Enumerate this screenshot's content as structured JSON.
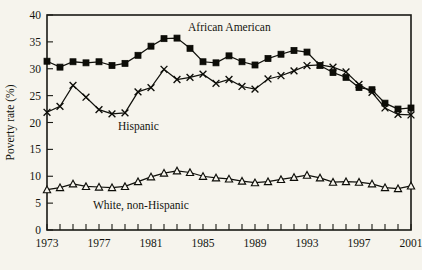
{
  "figure": {
    "background_color": "#f6f4ed",
    "ink_color": "#14140f",
    "width": 422,
    "height": 270
  },
  "axes": {
    "ylabel": "Poverty rate (%)",
    "xlabel": "",
    "y_ticks": [
      "0",
      "5",
      "10",
      "15",
      "20",
      "25",
      "30",
      "35",
      "40"
    ],
    "x_ticks": [
      "1973",
      "1977",
      "1981",
      "1985",
      "1989",
      "1993",
      "1997",
      "2001"
    ]
  },
  "annotations": {
    "african_american_label": "African American",
    "hispanic_label": "Hispanic",
    "white_label": "White, non-Hispanic"
  },
  "chart_data": {
    "type": "line",
    "title": "",
    "xlabel": "",
    "ylabel": "Poverty rate (%)",
    "xlim": [
      1973,
      2001
    ],
    "ylim": [
      0,
      40
    ],
    "ytick_step": 5,
    "xtick_step": 1,
    "xtick_label_step": 4,
    "grid": false,
    "legend": "inline-annotations",
    "x": [
      1973,
      1974,
      1975,
      1976,
      1977,
      1978,
      1979,
      1980,
      1981,
      1982,
      1983,
      1984,
      1985,
      1986,
      1987,
      1988,
      1989,
      1990,
      1991,
      1992,
      1993,
      1994,
      1995,
      1996,
      1997,
      1998,
      1999,
      2000,
      2001
    ],
    "series": [
      {
        "name": "African American",
        "marker": "filled-square",
        "values": [
          31.4,
          30.3,
          31.3,
          31.1,
          31.3,
          30.6,
          31.0,
          32.5,
          34.2,
          35.6,
          35.7,
          33.8,
          31.3,
          31.1,
          32.4,
          31.3,
          30.7,
          31.9,
          32.7,
          33.4,
          33.1,
          30.6,
          29.3,
          28.4,
          26.5,
          26.1,
          23.6,
          22.5,
          22.7
        ]
      },
      {
        "name": "Hispanic",
        "marker": "x",
        "values": [
          21.9,
          23.0,
          26.9,
          24.7,
          22.4,
          21.6,
          21.8,
          25.7,
          26.5,
          29.9,
          28.0,
          28.4,
          29.0,
          27.3,
          28.0,
          26.7,
          26.2,
          28.1,
          28.7,
          29.6,
          30.6,
          30.7,
          30.3,
          29.4,
          27.1,
          25.6,
          22.7,
          21.5,
          21.4
        ]
      },
      {
        "name": "White, non-Hispanic",
        "marker": "open-triangle",
        "values": [
          7.5,
          7.9,
          8.6,
          8.1,
          8.0,
          7.9,
          8.1,
          9.0,
          9.9,
          10.6,
          11.0,
          10.7,
          10.0,
          9.7,
          9.5,
          9.1,
          8.8,
          9.0,
          9.4,
          9.8,
          10.2,
          9.7,
          8.9,
          9.0,
          8.9,
          8.6,
          7.9,
          7.7,
          8.2
        ]
      }
    ]
  }
}
